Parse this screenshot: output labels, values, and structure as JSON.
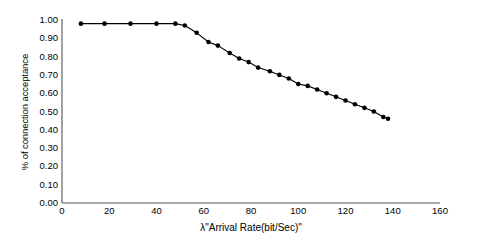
{
  "chart_data": {
    "type": "line",
    "title": "",
    "subtitle": "",
    "xlabel": "λ\"Arrival Rate(bit/Sec)\"",
    "ylabel": "% of connection acceptance",
    "xlim": [
      0,
      160
    ],
    "ylim": [
      0.0,
      1.0
    ],
    "grid": false,
    "legend": null,
    "marker": "filled-circle",
    "line_color": "#000000",
    "marker_color": "#000000",
    "xticks": [
      0,
      20,
      40,
      60,
      80,
      100,
      120,
      140,
      160
    ],
    "xtick_labels": [
      "0",
      "20",
      "40",
      "60",
      "80",
      "100",
      "120",
      "140",
      "160"
    ],
    "yticks": [
      0.0,
      0.1,
      0.2,
      0.3,
      0.4,
      0.5,
      0.6,
      0.7,
      0.8,
      0.9,
      1.0
    ],
    "ytick_labels": [
      "0.00",
      "0.10",
      "0.20",
      "0.30",
      "0.40",
      "0.50",
      "0.60",
      "0.70",
      "0.80",
      "0.90",
      "1.00"
    ],
    "series": [
      {
        "name": "% of connection acceptance",
        "x": [
          8,
          18,
          29,
          40,
          48,
          52,
          57,
          62,
          66,
          71,
          75,
          79,
          83,
          88,
          92,
          96,
          100,
          104,
          108,
          112,
          116,
          120,
          124,
          128,
          132,
          136,
          138
        ],
        "values": [
          0.98,
          0.98,
          0.98,
          0.98,
          0.98,
          0.97,
          0.93,
          0.88,
          0.86,
          0.82,
          0.79,
          0.77,
          0.74,
          0.72,
          0.7,
          0.68,
          0.65,
          0.64,
          0.62,
          0.6,
          0.58,
          0.56,
          0.54,
          0.52,
          0.5,
          0.47,
          0.46
        ]
      }
    ]
  },
  "axes": {
    "x_axis_name": "x-axis",
    "y_axis_name": "y-axis"
  }
}
